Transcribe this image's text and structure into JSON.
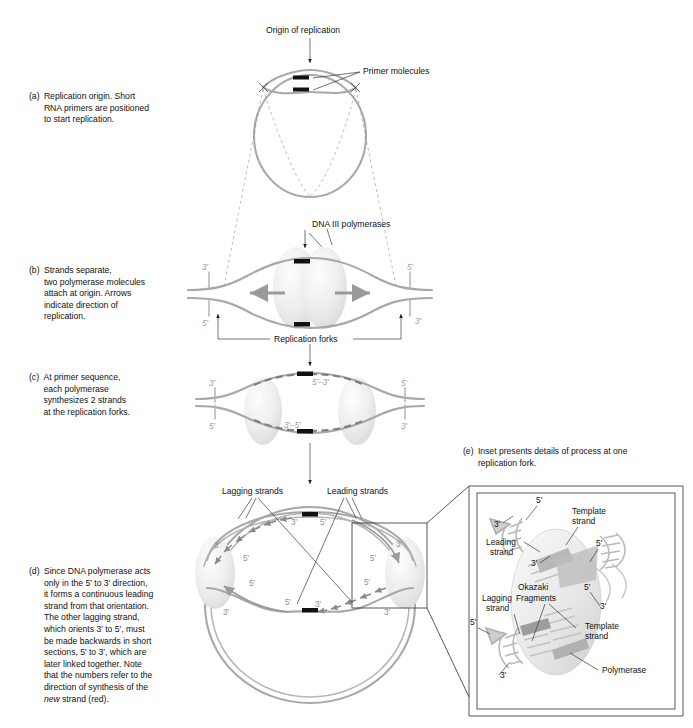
{
  "figure": {
    "title_visible": false,
    "background": "#ffffff",
    "strand_color": "#a8a8a8",
    "label_color": "#111111",
    "tick_color": "#9b9b9b"
  },
  "panels": [
    {
      "id": "a",
      "label": "(a)",
      "caption": "Replication origin. Short RNA primers are positioned to start replication.",
      "lines": [
        "Replication origin. Short",
        "RNA primers are positioned",
        "to start replication."
      ],
      "annotations": [
        {
          "name": "origin-of-replication",
          "text": "Origin of replication"
        },
        {
          "name": "primer-molecules",
          "text": "Primer molecules"
        }
      ]
    },
    {
      "id": "b",
      "label": "(b)",
      "caption": "Strands separate, two polymerase molecules attach at origin. Arrows indicate direction of replication.",
      "lines": [
        "Strands separate,",
        "two polymerase molecules",
        "attach at origin. Arrows",
        "indicate direction of",
        "replication."
      ],
      "annotations": [
        {
          "name": "dna-iii-polymerases",
          "text": "DNA III polymerases"
        },
        {
          "name": "replication-forks",
          "text": "Replication forks"
        }
      ],
      "end_ticks": [
        "3'",
        "5'",
        "5'",
        "3'"
      ]
    },
    {
      "id": "c",
      "label": "(c)",
      "caption": "At primer sequence, each polymerase synthesizes 2 strands at the replication forks.",
      "lines": [
        "At primer sequence,",
        "each polymerase",
        "synthesizes 2 strands",
        "at the replication forks."
      ],
      "strand_labels": [
        "5'–3'",
        "3'–5'"
      ],
      "end_ticks": [
        "3'",
        "5'",
        "5'",
        "3'"
      ]
    },
    {
      "id": "d",
      "label": "(d)",
      "caption": "Since DNA polymerase acts only in the 5' to 3' direction, it forms a continuous leading strand from that orientation. The other lagging strand, which orients 3' to 5', must be made backwards in short sections, 5' to 3', which are later linked together. Note that the numbers refer to the direction of synthesis of the new strand (red).",
      "lines": [
        "Since DNA polymerase acts",
        "only in the 5′ to 3′ direction,",
        "it forms a continuous leading",
        "strand from that orientation.",
        "The other lagging strand,",
        "which orients 3′ to 5′, must",
        "be made backwards in short",
        "sections, 5′ to 3′, which are",
        "later linked together. Note",
        "that the numbers refer to the",
        "direction of synthesis of the"
      ],
      "last_line_italic": "new",
      "last_line_rest": " strand (red).",
      "annotations": [
        {
          "name": "lagging-strands",
          "text": "Lagging strands"
        },
        {
          "name": "leading-strands",
          "text": "Leading strands"
        }
      ],
      "direction_labels": [
        "3'",
        "5'",
        "3'",
        "5'",
        "5'",
        "3'",
        "3'",
        "5'",
        "5'",
        "3'",
        "3'",
        "5'"
      ]
    },
    {
      "id": "e",
      "label": "(e)",
      "caption": "Inset presents details of process at one replication fork.",
      "lines": [
        "Inset presents details of process at one",
        "replication fork."
      ],
      "inset_labels": [
        {
          "name": "template-strand-top",
          "text": "Template\nstrand",
          "l1": "Template",
          "l2": "strand"
        },
        {
          "name": "template-strand-bottom",
          "text": "Template\nstrand",
          "l1": "Template",
          "l2": "strand"
        },
        {
          "name": "leading-strand",
          "l1": "Leading",
          "l2": "strand"
        },
        {
          "name": "lagging-strand",
          "l1": "Lagging",
          "l2": "strand"
        },
        {
          "name": "okazaki-fragments",
          "l1": "Okazaki",
          "l2": "Fragments"
        },
        {
          "name": "polymerase",
          "l1": "Polymerase",
          "l2": ""
        }
      ],
      "inset_ticks": [
        "5'",
        "3'",
        "3'",
        "5'",
        "5'",
        "3'",
        "5'",
        "3'"
      ]
    }
  ],
  "text": {
    "origin_of_replication": "Origin of replication",
    "primer_molecules": "Primer molecules",
    "dna_iii_polymerases": "DNA III polymerases",
    "replication_forks": "Replication forks",
    "lagging_strands": "Lagging strands",
    "leading_strands": "Leading strands",
    "five_three": "5′–3′",
    "three_five": "3′–5′",
    "t3": "3′",
    "t5": "5′",
    "template_strand_1": "Template",
    "template_strand_2": "strand",
    "leading_strand_1": "Leading",
    "leading_strand_2": "strand",
    "lagging_strand_1": "Lagging",
    "lagging_strand_2": "strand",
    "okazaki_1": "Okazaki",
    "okazaki_2": "Fragments",
    "polymerase": "Polymerase"
  }
}
